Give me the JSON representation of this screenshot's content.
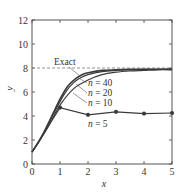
{
  "chart_data": {
    "type": "line",
    "title": "",
    "xlabel": "x",
    "ylabel": "y",
    "xlim": [
      0,
      5
    ],
    "ylim": [
      0,
      12
    ],
    "xticks": [
      0,
      1,
      2,
      3,
      4,
      5
    ],
    "yticks": [
      0,
      2,
      4,
      6,
      8,
      10,
      12
    ],
    "grid": false,
    "legend": "inline annotations",
    "series": [
      {
        "name": "Exact",
        "style": "dashed",
        "x": [
          0,
          5
        ],
        "y": [
          8,
          8
        ],
        "label": "Exact"
      },
      {
        "name": "n = 40",
        "style": "solid",
        "x": [
          0,
          0.25,
          0.5,
          0.75,
          1.0,
          1.25,
          1.5,
          1.75,
          2.0,
          2.5,
          3.0,
          3.5,
          4.0,
          5.0
        ],
        "y": [
          1.0,
          1.9,
          3.0,
          4.2,
          5.4,
          6.4,
          7.0,
          7.4,
          7.6,
          7.8,
          7.85,
          7.88,
          7.9,
          7.9
        ],
        "label": "n = 40"
      },
      {
        "name": "n = 20",
        "style": "solid",
        "x": [
          0,
          0.25,
          0.5,
          0.75,
          1.0,
          1.25,
          1.5,
          1.75,
          2.0,
          2.5,
          3.0,
          3.5,
          4.0,
          5.0
        ],
        "y": [
          1.0,
          1.85,
          2.9,
          4.1,
          5.2,
          6.15,
          6.8,
          7.2,
          7.45,
          7.7,
          7.8,
          7.85,
          7.88,
          7.9
        ],
        "label": "n = 20"
      },
      {
        "name": "n = 10",
        "style": "solid",
        "x": [
          0,
          0.5,
          1.0,
          1.5,
          2.0,
          2.5,
          3.0,
          3.5,
          4.0,
          4.5,
          5.0
        ],
        "y": [
          1.0,
          2.8,
          4.9,
          6.3,
          7.0,
          7.45,
          7.65,
          7.75,
          7.8,
          7.85,
          7.85
        ],
        "label": "n = 10"
      },
      {
        "name": "n = 5",
        "style": "solid-markers",
        "x": [
          0,
          1,
          2,
          3,
          4,
          5
        ],
        "y": [
          1.0,
          4.7,
          4.1,
          4.35,
          4.2,
          4.25
        ],
        "label": "n = 5"
      }
    ]
  },
  "labels": {
    "xlabel": "x",
    "ylabel": "y",
    "exact": "Exact",
    "n40": "n = 40",
    "n20": "n = 20",
    "n10": "n = 10",
    "n5": "n = 5"
  }
}
